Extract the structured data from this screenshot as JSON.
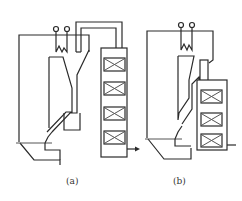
{
  "figure": {
    "panels": [
      {
        "id": "a",
        "caption": "(a)"
      },
      {
        "id": "b",
        "caption": "(b)"
      }
    ],
    "colors": {
      "stroke": "#2a2a2a",
      "background": "#ffffff"
    }
  }
}
